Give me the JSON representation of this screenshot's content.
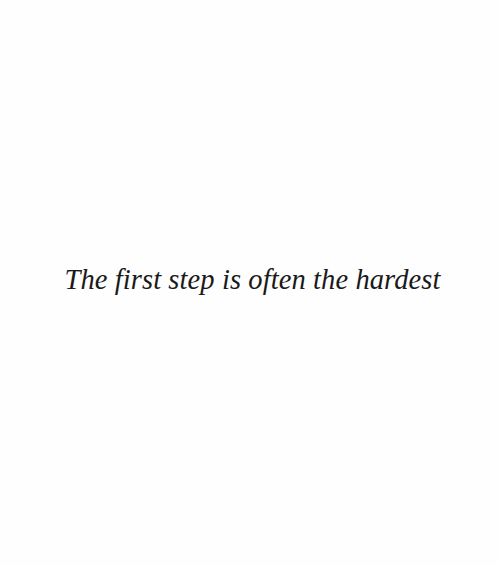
{
  "page": {
    "background_color": "#ffffff",
    "text_color": "#1a1a1a",
    "quote": "The first step is often the hardest"
  }
}
